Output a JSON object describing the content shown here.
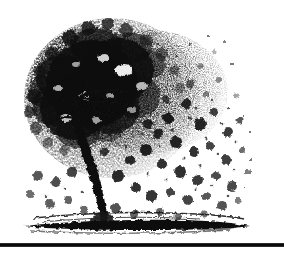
{
  "page": {
    "background_color": "#ffffff",
    "ink_color": "#101010",
    "width": 284,
    "height": 254,
    "media": "scanned black-and-white line illustration"
  },
  "figure": {
    "name": "tree-illustration",
    "alt_text": "Black and white stipple drawing of a leafy tree shedding its leaves",
    "technique": "stipple / halftone scan",
    "parts": {
      "canopy": {
        "label": "foliage canopy",
        "center_x": 118,
        "center_y": 100,
        "radius_x": 92,
        "radius_y": 84,
        "density": "dense on left, dissolving to the right"
      },
      "trunk": {
        "label": "curving trunk",
        "base_x": 100,
        "base_y": 222,
        "top_x": 78,
        "top_y": 120,
        "lean": "leans left then curves right at the base"
      },
      "ground": {
        "label": "ground line",
        "y": 224,
        "x_start": 22,
        "x_end": 250,
        "strokes": 4
      },
      "falling_leaves": {
        "label": "scattered falling leaves",
        "count": 86,
        "drift": "to the right and downward"
      }
    }
  },
  "rule": {
    "name": "page-rule",
    "label": "horizontal rule",
    "y": 243,
    "thickness": 4,
    "color": "#101010"
  }
}
